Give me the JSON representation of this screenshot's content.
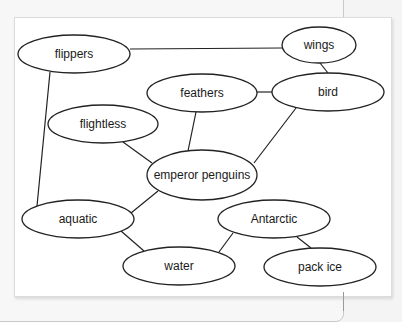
{
  "diagram": {
    "type": "concept-map",
    "nodes": [
      {
        "id": "flippers",
        "label": "flippers",
        "cx": 74,
        "cy": 54,
        "rx": 56,
        "ry": 19
      },
      {
        "id": "wings",
        "label": "wings",
        "cx": 319,
        "cy": 45,
        "rx": 37,
        "ry": 18
      },
      {
        "id": "feathers",
        "label": "feathers",
        "cx": 202,
        "cy": 93,
        "rx": 55,
        "ry": 19
      },
      {
        "id": "bird",
        "label": "bird",
        "cx": 328,
        "cy": 92,
        "rx": 56,
        "ry": 19
      },
      {
        "id": "flightless",
        "label": "flightless",
        "cx": 103,
        "cy": 124,
        "rx": 55,
        "ry": 19
      },
      {
        "id": "emperor_penguins",
        "label": "emperor penguins",
        "cx": 202,
        "cy": 175,
        "rx": 55,
        "ry": 25
      },
      {
        "id": "aquatic",
        "label": "aquatic",
        "cx": 78,
        "cy": 219,
        "rx": 56,
        "ry": 19
      },
      {
        "id": "antarctic",
        "label": "Antarctic",
        "cx": 274,
        "cy": 219,
        "rx": 56,
        "ry": 19
      },
      {
        "id": "water",
        "label": "water",
        "cx": 179,
        "cy": 266,
        "rx": 56,
        "ry": 19
      },
      {
        "id": "pack_ice",
        "label": "pack ice",
        "cx": 320,
        "cy": 267,
        "rx": 56,
        "ry": 19
      }
    ],
    "edges": [
      {
        "from": "flippers",
        "to": "wings",
        "x1": 130,
        "y1": 49,
        "x2": 282,
        "y2": 48
      },
      {
        "from": "wings",
        "to": "bird",
        "x1": 320,
        "y1": 63,
        "x2": 328,
        "y2": 73
      },
      {
        "from": "feathers",
        "to": "bird",
        "x1": 257,
        "y1": 92,
        "x2": 272,
        "y2": 92
      },
      {
        "from": "feathers",
        "to": "emperor_penguins",
        "x1": 196,
        "y1": 112,
        "x2": 188,
        "y2": 151
      },
      {
        "from": "flightless",
        "to": "emperor_penguins",
        "x1": 123,
        "y1": 142,
        "x2": 152,
        "y2": 163
      },
      {
        "from": "bird",
        "to": "emperor_penguins",
        "x1": 296,
        "y1": 108,
        "x2": 254,
        "y2": 163
      },
      {
        "from": "flippers",
        "to": "aquatic",
        "x1": 50,
        "y1": 72,
        "x2": 37,
        "y2": 206
      },
      {
        "from": "emperor_penguins",
        "to": "aquatic",
        "x1": 158,
        "y1": 191,
        "x2": 131,
        "y2": 213
      },
      {
        "from": "aquatic",
        "to": "water",
        "x1": 121,
        "y1": 231,
        "x2": 144,
        "y2": 251
      },
      {
        "from": "antarctic",
        "to": "water",
        "x1": 233,
        "y1": 233,
        "x2": 219,
        "y2": 252
      },
      {
        "from": "antarctic",
        "to": "pack_ice",
        "x1": 297,
        "y1": 237,
        "x2": 311,
        "y2": 248
      }
    ]
  },
  "colors": {
    "background": "#f4f4f4",
    "card": "#ffffff",
    "stroke": "#222222",
    "text": "#1a1a1a"
  }
}
